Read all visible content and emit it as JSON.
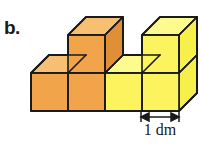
{
  "figure": {
    "label": "b.",
    "dimension_label": "1 dm",
    "background_color": "#ffffff",
    "outline_color": "#1a1a1a",
    "colors": {
      "orange_front": "#f2a council",
      "orange_front_hex": "#f1a44a",
      "orange_top": "#f7bf73",
      "orange_side": "#e08f36",
      "yellow_front": "#fbf45e",
      "yellow_top": "#fdfa8e",
      "yellow_side": "#f7ef4a"
    },
    "cubes": [
      {
        "name": "bottom-row-cube-1",
        "column": 1,
        "row": 1,
        "color": "orange"
      },
      {
        "name": "bottom-row-cube-2",
        "column": 2,
        "row": 1,
        "color": "orange"
      },
      {
        "name": "bottom-row-cube-3",
        "column": 3,
        "row": 1,
        "color": "yellow"
      },
      {
        "name": "bottom-row-cube-4",
        "column": 4,
        "row": 1,
        "color": "yellow"
      },
      {
        "name": "top-row-cube-2",
        "column": 2,
        "row": 2,
        "color": "orange"
      },
      {
        "name": "top-row-cube-4",
        "column": 4,
        "row": 2,
        "color": "yellow"
      }
    ],
    "cube_count": 6,
    "arrow": {
      "name": "dimension-arrow",
      "style": "double-headed",
      "measures": "one cube edge width"
    }
  }
}
